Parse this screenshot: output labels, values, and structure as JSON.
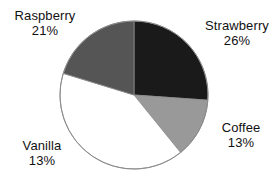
{
  "chart_data": {
    "type": "pie",
    "title": "",
    "subtitle": "",
    "xlabel": "",
    "ylabel": "",
    "grid": false,
    "legend_position": "none",
    "labels_position": "outside",
    "unit": "%",
    "categories": [
      "Strawberry",
      "Coffee",
      "Vanilla",
      "Raspberry"
    ],
    "values": [
      26,
      13,
      13,
      21
    ],
    "slices": [
      {
        "name": "Strawberry",
        "label": "Strawberry",
        "percent": 26,
        "percent_text": "26%",
        "color": "#1a1a1a",
        "start_angle_deg": 0,
        "end_angle_deg": 94
      },
      {
        "name": "Coffee",
        "label": "Coffee",
        "percent": 13,
        "percent_text": "13%",
        "color": "#999999",
        "start_angle_deg": 94,
        "end_angle_deg": 141
      },
      {
        "name": "Vanilla",
        "label": "Vanilla",
        "percent": 13,
        "percent_text": "13%",
        "color": "#ffffff",
        "start_angle_deg": 141,
        "end_angle_deg": 287
      },
      {
        "name": "Raspberry",
        "label": "Raspberry",
        "percent": 21,
        "percent_text": "21%",
        "color": "#555555",
        "start_angle_deg": 287,
        "end_angle_deg": 360
      }
    ],
    "geometry": {
      "center_x": 134,
      "center_y": 95,
      "radius": 74,
      "outline_color": "#8a8a8a"
    }
  },
  "labels": {
    "raspberry": {
      "name": "Raspberry",
      "percent": "21%"
    },
    "strawberry": {
      "name": "Strawberry",
      "percent": "26%"
    },
    "coffee": {
      "name": "Coffee",
      "percent": "13%"
    },
    "vanilla": {
      "name": "Vanilla",
      "percent": "13%"
    }
  },
  "colors": {
    "background": "#ffffff",
    "text": "#111111",
    "strawberry": "#1a1a1a",
    "coffee": "#999999",
    "vanilla": "#ffffff",
    "raspberry": "#555555",
    "outline": "#8a8a8a"
  }
}
